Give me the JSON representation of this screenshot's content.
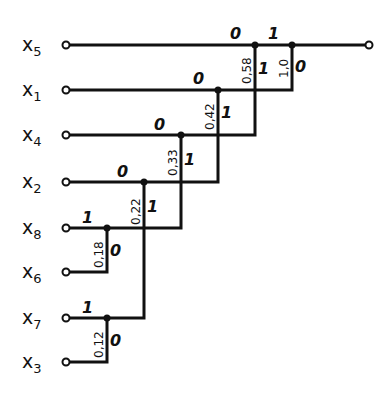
{
  "diagram": {
    "type": "huffman-code-tree",
    "inputs": [
      {
        "name": "x",
        "sub": "5",
        "y": 45
      },
      {
        "name": "x",
        "sub": "1",
        "y": 90
      },
      {
        "name": "x",
        "sub": "4",
        "y": 135
      },
      {
        "name": "x",
        "sub": "2",
        "y": 182
      },
      {
        "name": "x",
        "sub": "8",
        "y": 228
      },
      {
        "name": "x",
        "sub": "6",
        "y": 272
      },
      {
        "name": "x",
        "sub": "7",
        "y": 318
      },
      {
        "name": "x",
        "sub": "3",
        "y": 362
      }
    ],
    "merges": [
      {
        "prob": "0,12",
        "upper_bit": "1",
        "lower_bit": "0"
      },
      {
        "prob": "0,18",
        "upper_bit": "1",
        "lower_bit": "0"
      },
      {
        "prob": "0,22",
        "upper_bit": "0",
        "lower_bit": "1"
      },
      {
        "prob": "0,33",
        "upper_bit": "0",
        "lower_bit": "1"
      },
      {
        "prob": "0,42",
        "upper_bit": "0",
        "lower_bit": "1"
      },
      {
        "prob": "0,58",
        "upper_bit": "0",
        "lower_bit": "1"
      },
      {
        "prob": "1,0",
        "upper_bit": "1",
        "lower_bit": "0"
      }
    ]
  }
}
